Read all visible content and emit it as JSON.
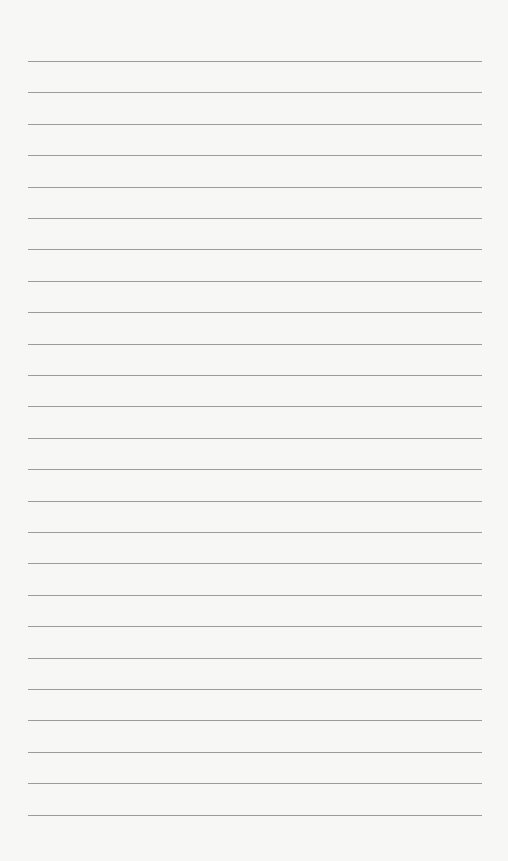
{
  "page": {
    "type": "lined-paper",
    "background_color": "#f7f7f5",
    "line_color": "#9c9c9c",
    "line_count": 25,
    "line_left": 28,
    "line_right": 482,
    "first_line_y": 61,
    "line_spacing": 31.4
  }
}
